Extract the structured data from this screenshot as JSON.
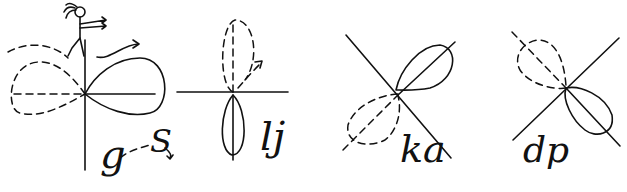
{
  "diagram": {
    "colors": {
      "ink": "#111111",
      "background": "#ffffff"
    },
    "panels": [
      {
        "id": "panel-1",
        "labels": [
          "g",
          "S"
        ],
        "figure": "stick-figure-walking"
      },
      {
        "id": "panel-2",
        "labels": [
          "lj"
        ]
      },
      {
        "id": "panel-3",
        "labels": [
          "ka"
        ]
      },
      {
        "id": "panel-4",
        "labels": [
          "dp"
        ]
      }
    ]
  }
}
